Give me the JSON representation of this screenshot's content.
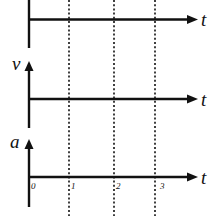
{
  "figure": {
    "colors": {
      "ink": "#111111",
      "background": "#ffffff"
    },
    "graphs": [
      {
        "id": "top",
        "y_label": "",
        "x_label": "t"
      },
      {
        "id": "middle",
        "y_label": "v",
        "x_label": "t"
      },
      {
        "id": "bottom",
        "y_label": "a",
        "x_label": "t"
      }
    ],
    "time_ticks": [
      "0",
      "1",
      "2",
      "3"
    ],
    "dotted_guides_at": [
      "1",
      "2",
      "3"
    ]
  }
}
